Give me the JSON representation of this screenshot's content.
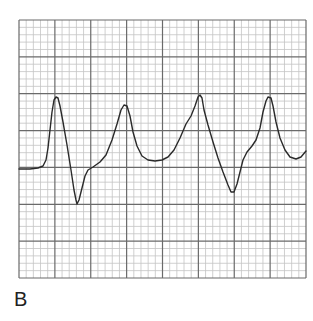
{
  "figure": {
    "panel_label": "B",
    "colors": {
      "background": "#ffffff",
      "minor_grid": "#c4c4c4",
      "major_grid": "#6a6a6a",
      "trace": "#2a2a2a",
      "label": "#222222"
    },
    "grid": {
      "left": 19,
      "top": 20,
      "right": 306,
      "bottom": 278,
      "major_columns": 8,
      "major_rows": 7,
      "minor_per_major": 5
    },
    "trace_points": [
      [
        19,
        169
      ],
      [
        30,
        169
      ],
      [
        38,
        168
      ],
      [
        43,
        166
      ],
      [
        46,
        160
      ],
      [
        48,
        148
      ],
      [
        50,
        130
      ],
      [
        52,
        112
      ],
      [
        54,
        100
      ],
      [
        56,
        97
      ],
      [
        58,
        98
      ],
      [
        60,
        106
      ],
      [
        63,
        122
      ],
      [
        67,
        145
      ],
      [
        71,
        170
      ],
      [
        74,
        190
      ],
      [
        76,
        200
      ],
      [
        77,
        204
      ],
      [
        79,
        200
      ],
      [
        82,
        188
      ],
      [
        85,
        176
      ],
      [
        88,
        170
      ],
      [
        93,
        167
      ],
      [
        100,
        162
      ],
      [
        106,
        155
      ],
      [
        112,
        140
      ],
      [
        117,
        124
      ],
      [
        121,
        110
      ],
      [
        124,
        105
      ],
      [
        127,
        106
      ],
      [
        130,
        116
      ],
      [
        133,
        132
      ],
      [
        137,
        146
      ],
      [
        142,
        156
      ],
      [
        148,
        160
      ],
      [
        155,
        161
      ],
      [
        162,
        160
      ],
      [
        168,
        157
      ],
      [
        174,
        150
      ],
      [
        180,
        138
      ],
      [
        186,
        124
      ],
      [
        191,
        116
      ],
      [
        195,
        106
      ],
      [
        198,
        97
      ],
      [
        200,
        95
      ],
      [
        202,
        98
      ],
      [
        204,
        110
      ],
      [
        208,
        125
      ],
      [
        213,
        142
      ],
      [
        218,
        158
      ],
      [
        223,
        172
      ],
      [
        228,
        185
      ],
      [
        231,
        192
      ],
      [
        234,
        192
      ],
      [
        237,
        184
      ],
      [
        240,
        172
      ],
      [
        243,
        160
      ],
      [
        247,
        152
      ],
      [
        252,
        146
      ],
      [
        256,
        140
      ],
      [
        260,
        128
      ],
      [
        263,
        112
      ],
      [
        266,
        101
      ],
      [
        268,
        97
      ],
      [
        271,
        98
      ],
      [
        273,
        106
      ],
      [
        276,
        122
      ],
      [
        280,
        138
      ],
      [
        285,
        150
      ],
      [
        290,
        157
      ],
      [
        296,
        159
      ],
      [
        301,
        157
      ],
      [
        306,
        151
      ]
    ]
  }
}
